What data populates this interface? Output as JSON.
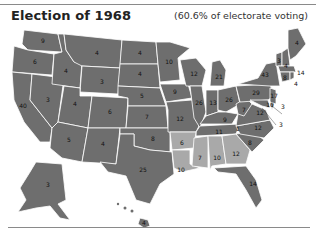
{
  "header": {
    "title": "Election of 1968",
    "subtitle": "(60.6% of electorate voting)"
  },
  "colors": {
    "dark_state": "#6e6e6e",
    "light_state": "#a9a9a9",
    "border": "#ffffff",
    "rule": "#8a8a8a"
  },
  "map": {
    "states": {
      "WA": "9",
      "OR": "6",
      "CA": "40",
      "ID": "4",
      "NV": "3",
      "MT": "4",
      "WY": "3",
      "UT": "4",
      "AZ": "5",
      "CO": "6",
      "NM": "4",
      "ND": "4",
      "SD": "4",
      "NE": "5",
      "KS": "7",
      "OK": "8",
      "TX": "25",
      "MN": "10",
      "IA": "9",
      "MO": "12",
      "AR": "6",
      "LA": "10",
      "WI": "12",
      "IL": "26",
      "MI": "21",
      "IN": "13",
      "OH": "26",
      "KY": "9",
      "TN": "11",
      "MS": "7",
      "AL": "10",
      "GA": "12",
      "FL": "14",
      "SC": "8",
      "NC": "12",
      "VA": "12",
      "WV": "7",
      "PA": "29",
      "NY": "43",
      "VT": "3",
      "NH": "4",
      "ME": "4",
      "MA": "14",
      "RI": "4",
      "CT": "8",
      "NJ": "17",
      "DE": "3",
      "MD": "10",
      "DC": "3",
      "AK": "3",
      "HI": "4",
      "NC_split": "1"
    }
  }
}
